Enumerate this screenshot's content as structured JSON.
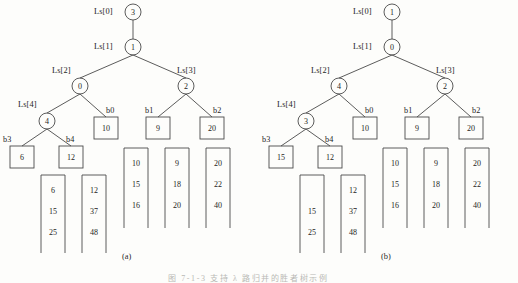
{
  "figure": {
    "caption": "图 7-1-3  支持 λ 路归并的胜者树示例",
    "panels": [
      {
        "key": "a",
        "label": "(a)",
        "tree": {
          "internal_nodes": [
            {
              "id": "Ls[0]",
              "value": "3",
              "shape": "circle"
            },
            {
              "id": "Ls[1]",
              "value": "1",
              "shape": "circle"
            },
            {
              "id": "Ls[2]",
              "value": "0",
              "shape": "circle"
            },
            {
              "id": "Ls[3]",
              "value": "2",
              "shape": "circle"
            },
            {
              "id": "Ls[4]",
              "value": "4",
              "shape": "circle"
            }
          ],
          "leaf_nodes": [
            {
              "id": "b0",
              "value": "10",
              "shape": "square"
            },
            {
              "id": "b1",
              "value": "9",
              "shape": "square"
            },
            {
              "id": "b2",
              "value": "20",
              "shape": "square"
            },
            {
              "id": "b3",
              "value": "6",
              "shape": "square"
            },
            {
              "id": "b4",
              "value": "12",
              "shape": "square"
            }
          ]
        },
        "runs": [
          {
            "name": "b3-run",
            "values": [
              "6",
              "15",
              "25"
            ]
          },
          {
            "name": "b4-run",
            "values": [
              "12",
              "37",
              "48"
            ]
          },
          {
            "name": "b0-run",
            "values": [
              "10",
              "15",
              "16"
            ]
          },
          {
            "name": "b1-run",
            "values": [
              "9",
              "18",
              "20"
            ]
          },
          {
            "name": "b2-run",
            "values": [
              "20",
              "22",
              "40"
            ]
          }
        ]
      },
      {
        "key": "b",
        "label": "(b)",
        "tree": {
          "internal_nodes": [
            {
              "id": "Ls[0]",
              "value": "1",
              "shape": "circle"
            },
            {
              "id": "Ls[1]",
              "value": "0",
              "shape": "circle"
            },
            {
              "id": "Ls[2]",
              "value": "4",
              "shape": "circle"
            },
            {
              "id": "Ls[3]",
              "value": "2",
              "shape": "circle"
            },
            {
              "id": "Ls[4]",
              "value": "3",
              "shape": "circle"
            }
          ],
          "leaf_nodes": [
            {
              "id": "b0",
              "value": "10",
              "shape": "square"
            },
            {
              "id": "b1",
              "value": "9",
              "shape": "square"
            },
            {
              "id": "b2",
              "value": "20",
              "shape": "square"
            },
            {
              "id": "b3",
              "value": "15",
              "shape": "square"
            },
            {
              "id": "b4",
              "value": "12",
              "shape": "square"
            }
          ]
        },
        "runs": [
          {
            "name": "b3-run",
            "values": [
              "15",
              "25"
            ]
          },
          {
            "name": "b4-run",
            "values": [
              "12",
              "37",
              "48"
            ]
          },
          {
            "name": "b0-run",
            "values": [
              "10",
              "15",
              "16"
            ]
          },
          {
            "name": "b1-run",
            "values": [
              "9",
              "18",
              "20"
            ]
          },
          {
            "name": "b2-run",
            "values": [
              "20",
              "22",
              "40"
            ]
          }
        ]
      }
    ]
  },
  "colors": {
    "stroke": "#4a4a4a",
    "text": "#1d1d1d",
    "background": "#fdfdfb"
  }
}
